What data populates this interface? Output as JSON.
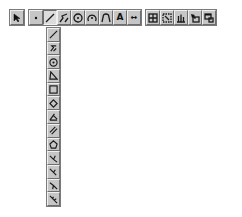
{
  "toolbar": {
    "groups": [
      {
        "name": "selection",
        "buttons": [
          {
            "id": "pointer",
            "icon": "arrow-pointer-icon"
          }
        ]
      },
      {
        "name": "construction",
        "buttons": [
          {
            "id": "point",
            "icon": "point-icon"
          },
          {
            "id": "line",
            "icon": "line-icon",
            "active": true
          },
          {
            "id": "polygon",
            "icon": "polygon-icon"
          },
          {
            "id": "circle-center",
            "icon": "circle-center-icon"
          },
          {
            "id": "arc",
            "icon": "arc-icon"
          },
          {
            "id": "conic",
            "icon": "conic-icon"
          },
          {
            "id": "text",
            "icon": "text-icon",
            "label": "A"
          },
          {
            "id": "measure",
            "icon": "measure-icon",
            "label": "↔"
          }
        ]
      },
      {
        "name": "view",
        "buttons": [
          {
            "id": "view-1",
            "icon": "grid-view-icon"
          },
          {
            "id": "view-2",
            "icon": "grid-select-icon"
          },
          {
            "id": "view-3",
            "icon": "chart-icon"
          },
          {
            "id": "view-4",
            "icon": "hand-window-icon"
          },
          {
            "id": "view-5",
            "icon": "window-icon"
          }
        ]
      }
    ]
  },
  "flyout": {
    "parent": "line",
    "items": [
      {
        "id": "line",
        "icon": "line-icon"
      },
      {
        "id": "segment-zigzag",
        "icon": "zigzag-icon"
      },
      {
        "id": "circle-point",
        "icon": "circle-point-icon"
      },
      {
        "id": "triangle",
        "icon": "triangle-icon"
      },
      {
        "id": "square",
        "icon": "square-icon"
      },
      {
        "id": "diamond",
        "icon": "diamond-icon"
      },
      {
        "id": "angle",
        "icon": "angle-icon"
      },
      {
        "id": "parallel",
        "icon": "parallel-icon"
      },
      {
        "id": "pentagon",
        "icon": "pentagon-icon"
      },
      {
        "id": "bisector-1",
        "icon": "bisector-icon"
      },
      {
        "id": "bisector-2",
        "icon": "bisector-icon"
      },
      {
        "id": "bisector-3",
        "icon": "bisector-icon"
      },
      {
        "id": "bisector-4",
        "icon": "bisector-icon"
      }
    ]
  }
}
